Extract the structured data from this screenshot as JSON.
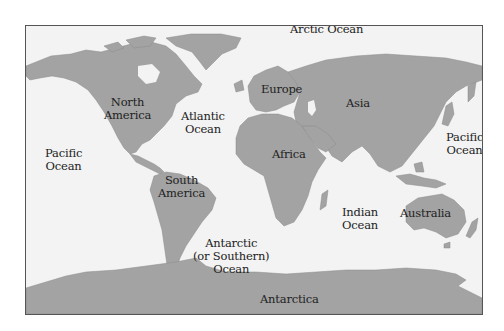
{
  "map": {
    "title": "",
    "colors": {
      "land": "#a3a3a3",
      "ocean": "#f3f3f3",
      "border": "#555555",
      "text": "#222222"
    },
    "labels": {
      "arctic_ocean": "Arctic Ocean",
      "north_america": "North\nAmerica",
      "atlantic_ocean": "Atlantic\nOcean",
      "europe": "Europe",
      "asia": "Asia",
      "pacific_ocean_west": "Pacific\nOcean",
      "pacific_ocean_east": "Pacific\nOcean",
      "africa": "Africa",
      "south_america": "South\nAmerica",
      "indian_ocean": "Indian\nOcean",
      "australia": "Australia",
      "antarctic_ocean": "Antarctic\n(or Southern)\nOcean",
      "antarctica": "Antarctica"
    }
  }
}
